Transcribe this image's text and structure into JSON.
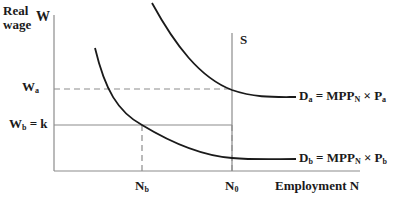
{
  "axes": {
    "y_label_line1": "Real",
    "y_label_line2": "wage",
    "y_symbol": "W",
    "x_label": "Employment N"
  },
  "levels": {
    "wa": {
      "main": "W",
      "sub": "a"
    },
    "wb": {
      "main": "W",
      "sub": "b",
      "suffix": " = k"
    }
  },
  "quantities": {
    "nb": {
      "main": "N",
      "sub": "b"
    },
    "n0": {
      "main": "N",
      "sub": "0"
    }
  },
  "supply": {
    "label": "S"
  },
  "curves": {
    "da": {
      "d": "D",
      "d_sub": "a",
      "eq": " = MPP",
      "mpp_sub": "N",
      "times": " × P",
      "p_sub": "a"
    },
    "db": {
      "d": "D",
      "d_sub": "b",
      "eq": " = MPP",
      "mpp_sub": "N",
      "times": " × P",
      "p_sub": "b"
    }
  },
  "colors": {
    "curve": "#1a1a1a",
    "axis": "#8c8c8c",
    "dashed": "#8c8c8c"
  }
}
